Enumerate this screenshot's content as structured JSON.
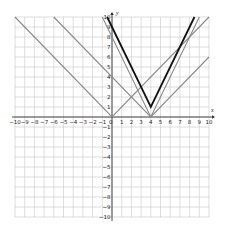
{
  "chart_data": {
    "type": "line",
    "title": "",
    "xlabel": "x",
    "ylabel": "y",
    "xlim": [
      -10,
      10
    ],
    "ylim": [
      -10,
      10
    ],
    "grid": true,
    "x_ticks": [
      -10,
      -9,
      -8,
      -7,
      -6,
      -5,
      -4,
      -3,
      -2,
      -1,
      1,
      2,
      3,
      4,
      5,
      6,
      7,
      8,
      9,
      10
    ],
    "y_ticks": [
      -10,
      -9,
      -8,
      -7,
      -6,
      -5,
      -4,
      -3,
      -2,
      -1,
      1,
      2,
      3,
      4,
      5,
      6,
      7,
      8,
      9,
      10
    ],
    "x_tick_labels": [
      "−10",
      "−9",
      "−8",
      "−7",
      "−6",
      "−5",
      "−4",
      "−3",
      "−2",
      "−1",
      "1",
      "2",
      "3",
      "4",
      "5",
      "6",
      "7",
      "8",
      "9",
      "10"
    ],
    "y_tick_labels": [
      "−10",
      "−9",
      "−8",
      "−7",
      "−6",
      "−5",
      "−4",
      "−3",
      "−2",
      "−1",
      "1",
      "2",
      "3",
      "4",
      "5",
      "6",
      "7",
      "8",
      "9",
      "10"
    ],
    "origin_label": "0",
    "series": [
      {
        "name": "y = |x|",
        "color": "#8a8a8a",
        "width": 1.1,
        "points": [
          [
            -10,
            10
          ],
          [
            0,
            0
          ],
          [
            10,
            10
          ]
        ]
      },
      {
        "name": "y = |x - 4|",
        "color": "#8a8a8a",
        "width": 1.1,
        "points": [
          [
            -6,
            10
          ],
          [
            4,
            0
          ],
          [
            10,
            6
          ]
        ]
      },
      {
        "name": "y = 2|x - 4|",
        "color": "#8a8a8a",
        "width": 1.1,
        "points": [
          [
            -1,
            10
          ],
          [
            4,
            0
          ],
          [
            9,
            10
          ]
        ]
      },
      {
        "name": "y = 2|x - 4| + 1",
        "color": "#111111",
        "width": 1.8,
        "points": [
          [
            -0.5,
            10
          ],
          [
            4,
            1
          ],
          [
            8.5,
            10
          ]
        ]
      }
    ]
  }
}
